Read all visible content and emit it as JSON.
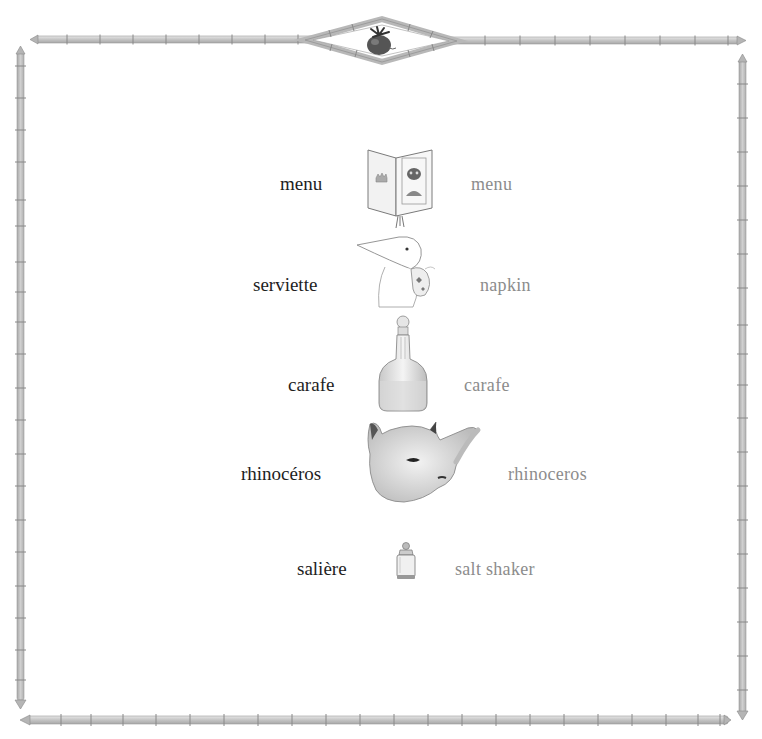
{
  "page": {
    "ornament": "tomato-icon",
    "frame_style": "bamboo",
    "colors": {
      "background": "#ffffff",
      "french_text": "#1e1e1e",
      "english_text": "#8c8c8c",
      "bamboo": "#c9c9c9",
      "bamboo_edge": "#8f8f8f",
      "tomato": "#4a4a4a"
    }
  },
  "vocabulary": [
    {
      "french": "menu",
      "illustration": "menu-book-icon",
      "english": "menu"
    },
    {
      "french": "serviette",
      "illustration": "bird-napkin-icon",
      "english": "napkin"
    },
    {
      "french": "carafe",
      "illustration": "carafe-icon",
      "english": "carafe"
    },
    {
      "french": "rhinocéros",
      "illustration": "rhinoceros-icon",
      "english": "rhinoceros"
    },
    {
      "french": "salière",
      "illustration": "salt-shaker-icon",
      "english": "salt shaker"
    }
  ]
}
